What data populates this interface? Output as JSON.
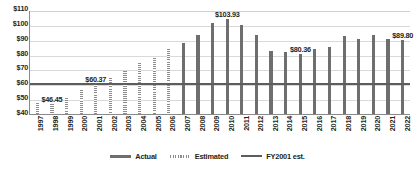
{
  "chart_data": {
    "type": "bar",
    "title": "",
    "subtitle": "",
    "xlabel": "",
    "ylabel": "",
    "ylim": [
      40,
      110
    ],
    "ytick_values": [
      110,
      100,
      90,
      80,
      70,
      60,
      50,
      40
    ],
    "ytick_labels": [
      "$110",
      "$100",
      "$90",
      "$80",
      "$70",
      "$60",
      "$50",
      "$40"
    ],
    "grid": true,
    "legend_position": "bottom-center",
    "categories": [
      "1997",
      "1998",
      "1999",
      "2000",
      "2001",
      "2002",
      "2003",
      "2004",
      "2005",
      "2006",
      "2007",
      "2008",
      "2009",
      "2010",
      "2011",
      "2012",
      "2013",
      "2014",
      "2015",
      "2016",
      "2017",
      "2018",
      "2019",
      "2020",
      "2021",
      "2022"
    ],
    "values": [
      47.3,
      46.45,
      50.5,
      56.0,
      60.37,
      64.5,
      69.0,
      74.5,
      78.0,
      84.0,
      88.0,
      93.0,
      101.2,
      103.93,
      100.0,
      93.0,
      82.2,
      81.7,
      80.36,
      84.0,
      85.0,
      92.2,
      90.7,
      93.0,
      90.5,
      89.8
    ],
    "series_of_point": [
      "Estimated",
      "Estimated",
      "Estimated",
      "Estimated",
      "Estimated",
      "Estimated",
      "Estimated",
      "Estimated",
      "Estimated",
      "Estimated",
      "Actual",
      "Actual",
      "Actual",
      "Actual",
      "Actual",
      "Actual",
      "Actual",
      "Actual",
      "Actual",
      "Actual",
      "Actual",
      "Actual",
      "Actual",
      "Actual",
      "Actual",
      "Actual"
    ],
    "reference_line": {
      "label": "FY2001 est.",
      "value": 61.5
    },
    "annotations": [
      {
        "category": "1998",
        "text": "$46.45",
        "value": 46.45
      },
      {
        "category": "2001",
        "text": "$60.37",
        "value": 60.37
      },
      {
        "category": "2010",
        "text": "$103.93",
        "value": 103.93
      },
      {
        "category": "2015",
        "text": "$80.36",
        "value": 80.36
      },
      {
        "category": "2022",
        "text": "$89.80",
        "value": 89.8
      }
    ],
    "legend": [
      {
        "label": "Actual",
        "style": "solid-bar",
        "color": "#6e6e6e"
      },
      {
        "label": "Estimated",
        "style": "hatched-bar",
        "color": "#8c8c8c"
      },
      {
        "label": "FY2001 est.",
        "style": "line",
        "color": "#5d5d5d"
      }
    ]
  },
  "colors": {
    "actual_bar": "#6e6e6e",
    "estimated_bar": "#8c8c8c",
    "reference_line": "#5d5d5d",
    "gridline": "#d9d9d9",
    "axis": "#8a8a8a",
    "text": "#231f20",
    "background": "#ffffff"
  }
}
